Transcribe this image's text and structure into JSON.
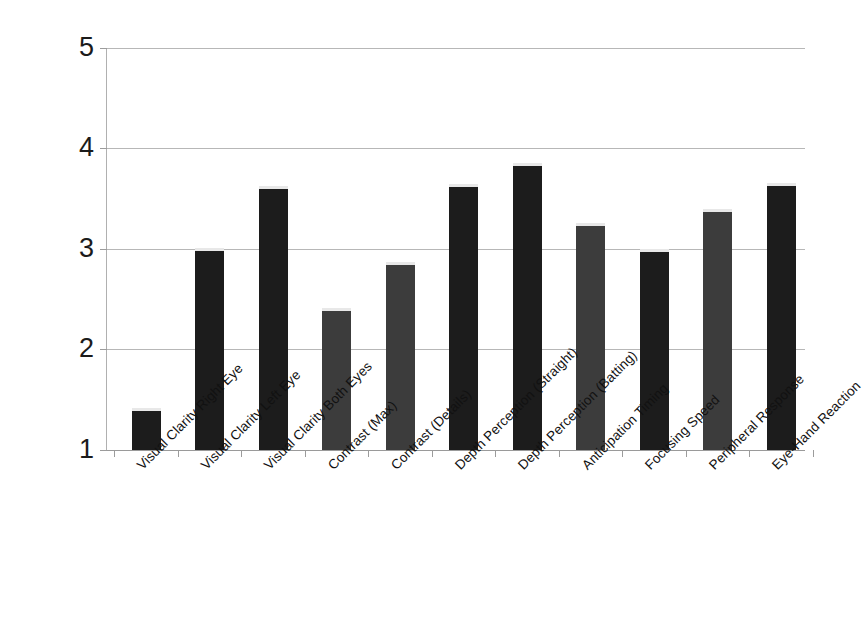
{
  "chart_data": {
    "type": "bar",
    "title": "",
    "subtitle": "",
    "xlabel": "",
    "ylabel": "",
    "ylim": [
      1,
      5
    ],
    "yticks": [
      "1",
      "2",
      "3",
      "4",
      "5"
    ],
    "grid": true,
    "legend": "none",
    "categories": [
      "Visual Clarity Right Eye",
      "Visual Clarity Left Eye",
      "Visual Clarity Both Eyes",
      "Contrast (Max)",
      "Contrast (Details)",
      "Depth Perception (Straight)",
      "Depth Perception (Batting)",
      "Anticipation Timing",
      "Focusing Speed",
      "Peripheral Response",
      "Eye-Hand Reaction"
    ],
    "values": [
      1.42,
      3.01,
      3.63,
      2.41,
      2.87,
      3.65,
      3.86,
      3.26,
      3.0,
      3.4,
      3.66
    ],
    "bar_colors": [
      "#1c1c1c",
      "#1c1c1c",
      "#1c1c1c",
      "#3c3c3c",
      "#3c3c3c",
      "#1c1c1c",
      "#1c1c1c",
      "#3c3c3c",
      "#1c1c1c",
      "#3c3c3c",
      "#1c1c1c"
    ],
    "colors": {
      "bar_dark": "#1c1c1c",
      "bar_grey": "#3c3c3c",
      "gridline": "#b7b7b7",
      "axis": "#9c9c9c",
      "text": "#111111",
      "background": "#ffffff"
    }
  }
}
